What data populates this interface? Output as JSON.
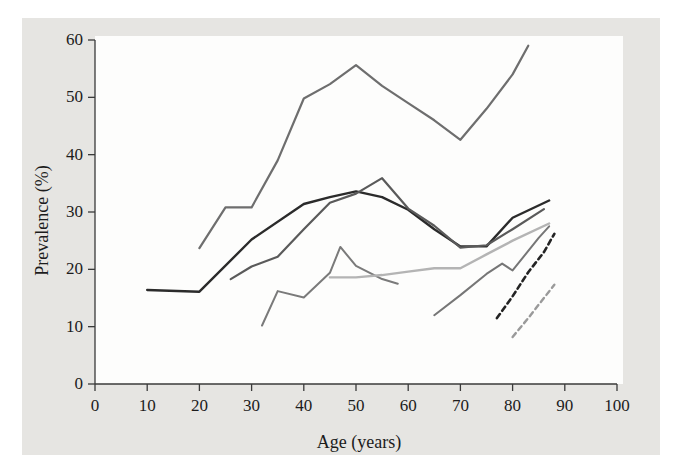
{
  "chart_data": {
    "type": "line",
    "title": "",
    "xlabel": "Age (years)",
    "ylabel": "Prevalence (%)",
    "xlim": [
      0,
      100
    ],
    "ylim": [
      0,
      60
    ],
    "xticks": [
      0,
      10,
      20,
      30,
      40,
      50,
      60,
      70,
      80,
      90,
      100
    ],
    "yticks": [
      0,
      10,
      20,
      30,
      40,
      50,
      60
    ],
    "grid": false,
    "legend": "none",
    "series": [
      {
        "name": "series-1-black-solid",
        "style": "solid",
        "color": "#2b2b2b",
        "width": 2.4,
        "x": [
          10,
          20,
          30,
          40,
          45,
          50,
          55,
          60,
          65,
          70,
          75,
          80,
          87
        ],
        "y": [
          16.4,
          16.1,
          25.2,
          31.4,
          32.6,
          33.6,
          32.6,
          30.4,
          27.0,
          24.0,
          24.0,
          29.0,
          32.0
        ]
      },
      {
        "name": "series-2-gray-peak",
        "style": "solid",
        "color": "#6e6e6e",
        "width": 2.2,
        "x": [
          20,
          25,
          30,
          35,
          40,
          45,
          50,
          55,
          60,
          65,
          70,
          75,
          80,
          83
        ],
        "y": [
          23.7,
          30.8,
          30.8,
          39.0,
          49.8,
          52.3,
          55.6,
          52.0,
          49.0,
          46.0,
          42.6,
          48.0,
          54.0,
          59.0
        ]
      },
      {
        "name": "series-3-midgray-rise",
        "style": "solid",
        "color": "#5a5a5a",
        "width": 2.2,
        "x": [
          26,
          30,
          35,
          40,
          45,
          50,
          55,
          60,
          65,
          70,
          75,
          80,
          86
        ],
        "y": [
          18.3,
          20.5,
          22.2,
          27.0,
          31.6,
          33.2,
          35.9,
          30.6,
          27.6,
          23.8,
          24.2,
          27.0,
          30.5
        ]
      },
      {
        "name": "series-4-lowgray-zigzag",
        "style": "solid",
        "color": "#7a7a7a",
        "width": 2.0,
        "x": [
          32,
          35,
          40,
          45,
          47,
          50,
          55,
          58
        ],
        "y": [
          10.2,
          16.2,
          15.1,
          19.4,
          23.9,
          20.6,
          18.3,
          17.5
        ]
      },
      {
        "name": "series-5-lightgray-flat",
        "style": "solid",
        "color": "#b4b4b4",
        "width": 2.4,
        "x": [
          45,
          50,
          55,
          60,
          65,
          70,
          75,
          80,
          87
        ],
        "y": [
          18.6,
          18.6,
          19.0,
          19.6,
          20.2,
          20.2,
          22.6,
          25.0,
          28.0
        ]
      },
      {
        "name": "series-6-gray-elderly",
        "style": "solid",
        "color": "#767676",
        "width": 2.0,
        "x": [
          65,
          70,
          75,
          78,
          80,
          85,
          87
        ],
        "y": [
          12.0,
          15.5,
          19.2,
          21.0,
          19.8,
          25.5,
          27.5
        ]
      },
      {
        "name": "series-7-dark-dashed",
        "style": "dashed",
        "color": "#242424",
        "width": 2.6,
        "x": [
          77,
          80,
          83,
          86,
          88
        ],
        "y": [
          11.5,
          15.3,
          19.5,
          23.0,
          26.2
        ]
      },
      {
        "name": "series-8-light-dashed",
        "style": "dashed",
        "color": "#9a9a9a",
        "width": 2.4,
        "x": [
          80,
          83,
          86,
          88
        ],
        "y": [
          8.2,
          11.5,
          15.0,
          17.3
        ]
      }
    ]
  },
  "axes": {
    "x_tick_labels": [
      "0",
      "10",
      "20",
      "30",
      "40",
      "50",
      "60",
      "70",
      "80",
      "90",
      "100"
    ],
    "y_tick_labels": [
      "0",
      "10",
      "20",
      "30",
      "40",
      "50",
      "60"
    ],
    "x_axis_title": "Age (years)",
    "y_axis_title": "Prevalence (%)"
  },
  "colors": {
    "page_background": "#e6e5e2",
    "plot_background": "#fdfdfc",
    "axis": "#3a3a3a",
    "text": "#1c1c1c"
  }
}
